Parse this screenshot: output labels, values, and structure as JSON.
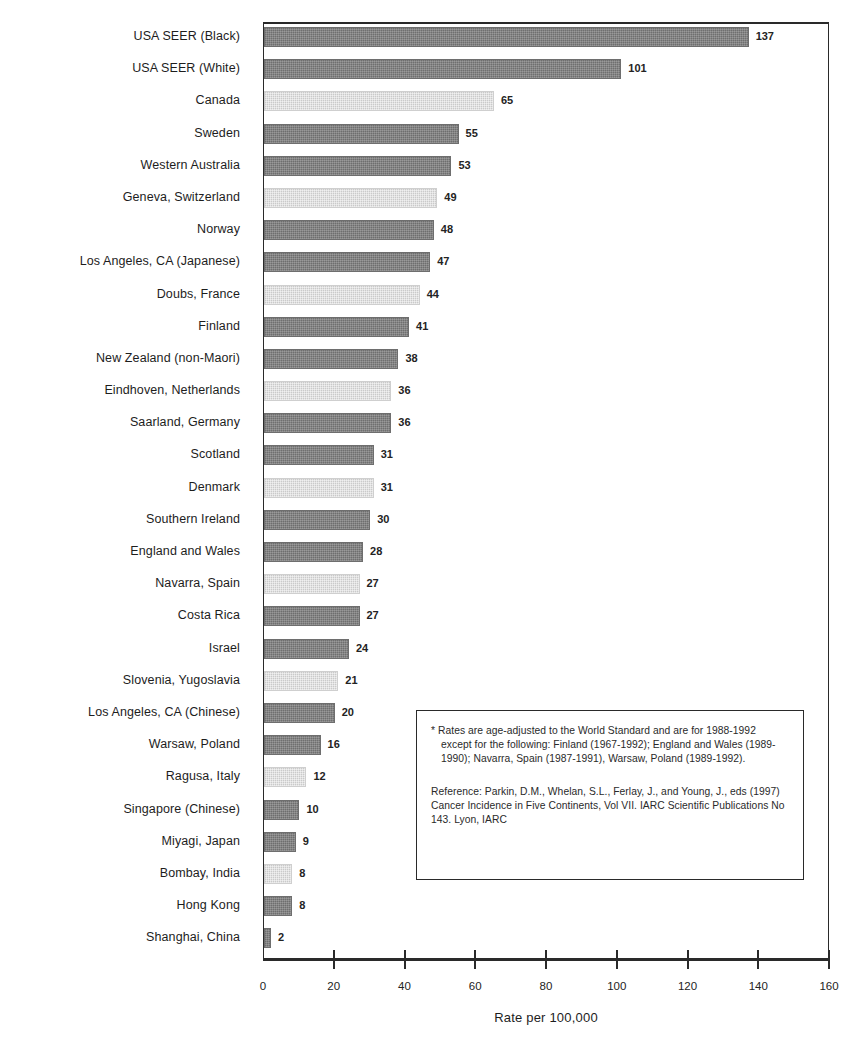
{
  "chart_data": {
    "type": "bar",
    "orientation": "horizontal",
    "title": "",
    "subtitle": "",
    "xlabel": "Rate per 100,000",
    "ylabel": "",
    "xlim": [
      0,
      160
    ],
    "xticks": [
      0,
      20,
      40,
      60,
      80,
      100,
      120,
      140,
      160
    ],
    "xtick_labels": [
      "0",
      "20",
      "40",
      "60",
      "80",
      "100",
      "120",
      "140",
      "160"
    ],
    "grid": false,
    "legend": null,
    "data_labels": true,
    "categories": [
      "USA SEER (Black)",
      "USA SEER (White)",
      "Canada",
      "Sweden",
      "Western Australia",
      "Geneva, Switzerland",
      "Norway",
      "Los Angeles, CA (Japanese)",
      "Doubs, France",
      "Finland",
      "New Zealand (non-Maori)",
      "Eindhoven, Netherlands",
      "Saarland, Germany",
      "Scotland",
      "Denmark",
      "Southern Ireland",
      "England and Wales",
      "Navarra, Spain",
      "Costa Rica",
      "Israel",
      "Slovenia, Yugoslavia",
      "Los Angeles, CA (Chinese)",
      "Warsaw, Poland",
      "Ragusa, Italy",
      "Singapore (Chinese)",
      "Miyagi, Japan",
      "Bombay, India",
      "Hong Kong",
      "Shanghai, China"
    ],
    "values": [
      137,
      101,
      65,
      55,
      53,
      49,
      48,
      47,
      44,
      41,
      38,
      36,
      36,
      31,
      31,
      30,
      28,
      27,
      27,
      24,
      21,
      20,
      16,
      12,
      10,
      9,
      8,
      8,
      2
    ],
    "value_labels": [
      "137",
      "101",
      "65",
      "55",
      "53",
      "49",
      "48",
      "47",
      "44",
      "41",
      "38",
      "36",
      "36",
      "31",
      "31",
      "30",
      "28",
      "27",
      "27",
      "24",
      "21",
      "20",
      "16",
      "12",
      "10",
      "9",
      "8",
      "8",
      "2"
    ],
    "bar_shades": [
      "dark",
      "dark",
      "light",
      "dark",
      "dark",
      "light",
      "dark",
      "dark",
      "light",
      "dark",
      "dark",
      "light",
      "dark",
      "dark",
      "light",
      "dark",
      "dark",
      "light",
      "dark",
      "dark",
      "light",
      "dark",
      "dark",
      "light",
      "dark",
      "dark",
      "light",
      "dark",
      "dark"
    ],
    "colors": {
      "dark_bar": "#7b7b7b",
      "light_bar": "#d9d9d9",
      "axis": "#2a2a2a",
      "text": "#1d1d1d"
    }
  },
  "notes": {
    "footnote": "* Rates are age-adjusted to the World Standard and are for 1988-1992 except for the following:  Finland (1967-1992); England and Wales (1989-1990); Navarra, Spain (1987-1991), Warsaw, Poland (1989-1992).",
    "reference": "Reference:  Parkin, D.M., Whelan, S.L., Ferlay, J., and Young, J., eds (1997) Cancer Incidence in Five Continents, Vol VII.  IARC Scientific Publications No 143.  Lyon, IARC"
  }
}
